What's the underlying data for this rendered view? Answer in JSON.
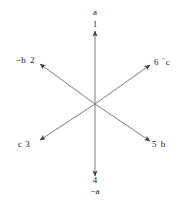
{
  "figure": {
    "type": "vector-axes-diagram",
    "origin": {
      "x": 95,
      "y": 104
    },
    "line_color": "#6b6b6b",
    "text_color": "#1a1a1a",
    "background": "#ffffff"
  },
  "axes": [
    {
      "id": "axis-1",
      "number": "1",
      "axis_label": "a",
      "direction": "up",
      "angle_deg": 90,
      "tip": {
        "x": 95,
        "y": 30
      },
      "label_order": "axis-then-number"
    },
    {
      "id": "axis-2",
      "number": "2",
      "axis_label": "−b",
      "direction": "upper-left",
      "angle_deg": 150,
      "tip": {
        "x": 38,
        "y": 63
      },
      "label_order": "axis-then-number"
    },
    {
      "id": "axis-3",
      "number": "3",
      "axis_label": "c",
      "direction": "lower-left",
      "angle_deg": 210,
      "tip": {
        "x": 38,
        "y": 141
      },
      "label_order": "axis-then-number"
    },
    {
      "id": "axis-4",
      "number": "4",
      "axis_label": "−a",
      "direction": "down",
      "angle_deg": 270,
      "tip": {
        "x": 95,
        "y": 175
      },
      "label_order": "number-then-axis"
    },
    {
      "id": "axis-5",
      "number": "5",
      "axis_label": "b",
      "direction": "lower-right",
      "angle_deg": 330,
      "tip": {
        "x": 152,
        "y": 142
      },
      "label_order": "number-then-axis"
    },
    {
      "id": "axis-6",
      "number": "6",
      "axis_label": "⁺c",
      "axis_label_prefix": "−",
      "axis_label_base": "c",
      "direction": "upper-right",
      "angle_deg": 30,
      "tip": {
        "x": 152,
        "y": 64
      },
      "label_order": "number-then-axis"
    }
  ],
  "labels": {
    "top": {
      "axis": "a",
      "number": "1"
    },
    "upper_left": {
      "axis": "−b",
      "number": "2"
    },
    "lower_left": {
      "axis": "c",
      "number": "3"
    },
    "bottom": {
      "number": "4",
      "axis": "−a"
    },
    "lower_right": {
      "number": "5",
      "axis": "b"
    },
    "upper_right": {
      "number": "6",
      "axis_minus": "−",
      "axis_base": "c"
    }
  }
}
